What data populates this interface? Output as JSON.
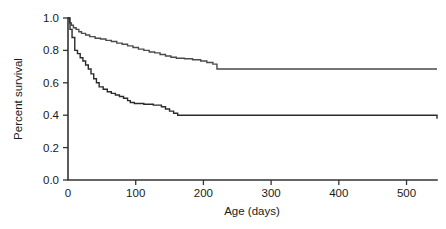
{
  "chart_data": {
    "type": "line",
    "subtype": "kaplan-meier-step",
    "title": "",
    "xlabel": "Age (days)",
    "ylabel": "Percent survival",
    "xlim": [
      0,
      545
    ],
    "ylim": [
      0.0,
      1.0
    ],
    "grid": false,
    "legend": "none",
    "xticks": [
      0,
      100,
      200,
      300,
      400,
      500
    ],
    "xtick_labels": [
      "0",
      "100",
      "200",
      "300",
      "400",
      "500"
    ],
    "yticks": [
      0.0,
      0.2,
      0.4,
      0.6,
      0.8,
      1.0
    ],
    "ytick_labels": [
      "0.0",
      "0.2",
      "0.4",
      "0.6",
      "0.8",
      "1.0"
    ],
    "series": [
      {
        "name": "upper-survival-curve",
        "color": "#4a4a4a",
        "x": [
          0,
          2,
          5,
          8,
          12,
          16,
          20,
          26,
          32,
          40,
          48,
          56,
          64,
          72,
          80,
          88,
          96,
          104,
          112,
          120,
          128,
          136,
          144,
          152,
          160,
          172,
          184,
          196,
          205,
          214,
          220,
          545
        ],
        "y": [
          1.0,
          0.97,
          0.955,
          0.94,
          0.93,
          0.915,
          0.905,
          0.895,
          0.885,
          0.875,
          0.87,
          0.862,
          0.855,
          0.845,
          0.838,
          0.828,
          0.818,
          0.808,
          0.8,
          0.79,
          0.785,
          0.775,
          0.765,
          0.758,
          0.752,
          0.748,
          0.742,
          0.735,
          0.725,
          0.715,
          0.685,
          0.685
        ]
      },
      {
        "name": "lower-survival-curve",
        "color": "#2b2b2b",
        "x": [
          0,
          3,
          6,
          10,
          14,
          18,
          22,
          26,
          30,
          34,
          38,
          42,
          46,
          52,
          58,
          64,
          70,
          76,
          82,
          88,
          92,
          98,
          112,
          126,
          138,
          144,
          150,
          156,
          162,
          470,
          545
        ],
        "y": [
          1.0,
          0.93,
          0.88,
          0.8,
          0.78,
          0.755,
          0.735,
          0.71,
          0.685,
          0.655,
          0.625,
          0.6,
          0.575,
          0.56,
          0.545,
          0.535,
          0.525,
          0.515,
          0.505,
          0.49,
          0.478,
          0.472,
          0.468,
          0.462,
          0.452,
          0.438,
          0.425,
          0.412,
          0.4,
          0.4,
          0.378
        ]
      }
    ]
  },
  "axes": {
    "y_axis_label": "Percent survival",
    "x_axis_label": "Age (days)"
  }
}
